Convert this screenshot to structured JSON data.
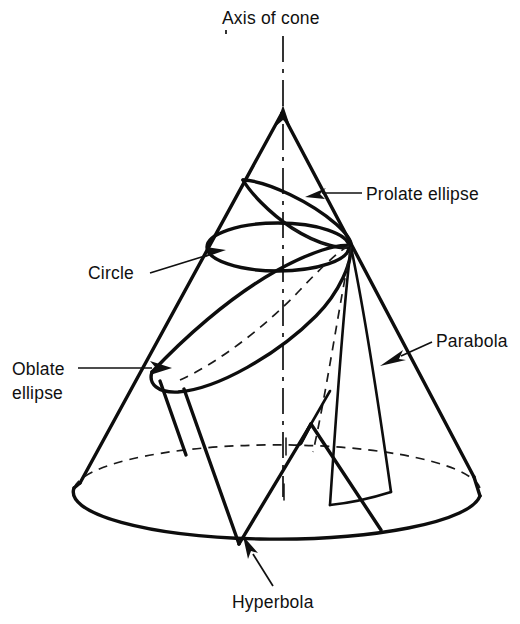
{
  "figure": {
    "background_color": "#ffffff",
    "line_color": "#0d0d0d"
  },
  "labels": {
    "axis": "Axis of cone",
    "prolate_ellipse": "Prolate ellipse",
    "parabola": "Parabola",
    "circle": "Circle",
    "oblate_line1": "Oblate",
    "oblate_line2": "ellipse",
    "hyperbola": "Hyperbola"
  },
  "geometry": {
    "apex": {
      "x": 282,
      "y": 112
    },
    "base_center": {
      "x": 277,
      "y": 492
    },
    "base_rx": 203,
    "base_ry": 47,
    "axis_top": {
      "x": 283,
      "y": 36
    },
    "axis_bottom": {
      "x": 283,
      "y": 497
    },
    "convergence_point": {
      "x": 351,
      "y": 246
    },
    "circle_cut": {
      "cx": 278,
      "cy": 247,
      "rx": 71,
      "ry": 24
    },
    "hyperbola_apex": {
      "x": 311,
      "y": 424
    }
  }
}
